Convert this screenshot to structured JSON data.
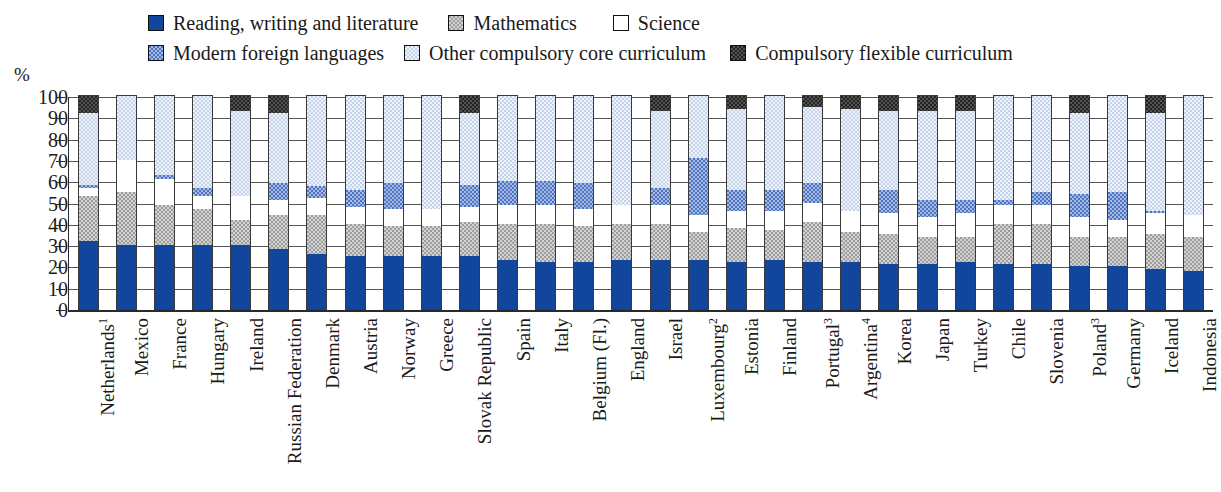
{
  "axis": {
    "unit_label": "%",
    "yticks": [
      0,
      10,
      20,
      30,
      40,
      50,
      60,
      70,
      80,
      90,
      100
    ]
  },
  "legend": {
    "items": [
      {
        "label": "Reading, writing and literature",
        "key": "reading",
        "color": "#12469c"
      },
      {
        "label": "Mathematics",
        "key": "math",
        "color": "#9d9d9d"
      },
      {
        "label": "Science",
        "key": "science",
        "color": "#ffffff"
      },
      {
        "label": "Modern foreign languages",
        "key": "mfl",
        "color": "#4e74c4"
      },
      {
        "label": "Other compulsory core curriculum",
        "key": "other",
        "color": "#c3d3ec"
      },
      {
        "label": "Compulsory flexible curriculum",
        "key": "flex",
        "color": "#232323"
      }
    ]
  },
  "chart_data": {
    "type": "bar",
    "title": "",
    "xlabel": "",
    "ylabel": "%",
    "ylim": [
      0,
      100
    ],
    "stacked": true,
    "grid": true,
    "legend_position": "top",
    "categories": [
      "Netherlands¹",
      "Mexico",
      "France",
      "Hungary",
      "Ireland",
      "Russian Federation",
      "Denmark",
      "Austria",
      "Norway",
      "Greece",
      "Slovak Republic",
      "Spain",
      "Italy",
      "Belgium (Fl.)",
      "England",
      "Israel",
      "Luxembourg²",
      "Estonia",
      "Finland",
      "Portugal³",
      "Argentina⁴",
      "Korea",
      "Japan",
      "Turkey",
      "Chile",
      "Slovenia",
      "Poland³",
      "Germany",
      "Iceland",
      "Indonesia"
    ],
    "series": [
      {
        "name": "Reading, writing and literature",
        "key": "reading",
        "values": [
          32,
          30,
          30,
          30,
          30,
          28,
          26,
          25,
          25,
          25,
          25,
          23,
          22,
          22,
          23,
          23,
          23,
          22,
          23,
          22,
          22,
          21,
          21,
          22,
          21,
          21,
          20,
          20,
          19,
          18
        ]
      },
      {
        "name": "Mathematics",
        "key": "math",
        "values": [
          21,
          25,
          19,
          17,
          12,
          16,
          18,
          15,
          14,
          14,
          16,
          17,
          18,
          17,
          17,
          17,
          13,
          16,
          14,
          19,
          14,
          14,
          13,
          12,
          19,
          19,
          14,
          14,
          16,
          16
        ]
      },
      {
        "name": "Science",
        "key": "science",
        "values": [
          4,
          15,
          12,
          6,
          11,
          7,
          8,
          8,
          8,
          8,
          7,
          9,
          9,
          8,
          9,
          9,
          8,
          8,
          9,
          9,
          10,
          10,
          9,
          11,
          9,
          9,
          9,
          8,
          10,
          10
        ]
      },
      {
        "name": "Modern foreign languages",
        "key": "mfl",
        "values": [
          1,
          0,
          2,
          4,
          0,
          8,
          6,
          8,
          12,
          0,
          10,
          11,
          11,
          12,
          0,
          8,
          27,
          10,
          10,
          9,
          0,
          11,
          8,
          6,
          2,
          6,
          11,
          13,
          1,
          0
        ]
      },
      {
        "name": "Other compulsory core curriculum",
        "key": "other",
        "values": [
          34,
          30,
          37,
          43,
          40,
          33,
          42,
          44,
          41,
          53,
          34,
          40,
          40,
          41,
          51,
          36,
          29,
          38,
          44,
          36,
          48,
          37,
          42,
          42,
          49,
          45,
          38,
          45,
          46,
          56
        ]
      },
      {
        "name": "Compulsory flexible curriculum",
        "key": "flex",
        "values": [
          8,
          0,
          0,
          0,
          7,
          8,
          0,
          0,
          0,
          0,
          8,
          0,
          0,
          0,
          0,
          7,
          0,
          6,
          0,
          5,
          6,
          7,
          7,
          7,
          0,
          0,
          8,
          0,
          8,
          0
        ]
      }
    ]
  }
}
